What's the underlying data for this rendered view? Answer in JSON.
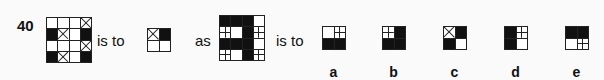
{
  "question": {
    "number": "40",
    "connector_1": "is to",
    "connector_2": "as",
    "connector_3": "is to",
    "legend": {
      "W": "white",
      "B": "black",
      "X": "crossed",
      "P": "quartered"
    },
    "grid_1": [
      [
        "W",
        "W",
        "W",
        "X"
      ],
      [
        "B",
        "X",
        "W",
        "B"
      ],
      [
        "W",
        "W",
        "W",
        "X"
      ],
      [
        "B",
        "X",
        "W",
        "B"
      ]
    ],
    "grid_2": [
      [
        "X",
        "B"
      ],
      [
        "W",
        "W"
      ]
    ],
    "grid_3": [
      [
        "B",
        "B",
        "B",
        "W"
      ],
      [
        "P",
        "W",
        "B",
        "P"
      ],
      [
        "B",
        "B",
        "B",
        "W"
      ],
      [
        "P",
        "W",
        "B",
        "P"
      ]
    ]
  },
  "options": [
    {
      "label": "a",
      "cells": [
        [
          "W",
          "P"
        ],
        [
          "B",
          "B"
        ]
      ]
    },
    {
      "label": "b",
      "cells": [
        [
          "P",
          "B"
        ],
        [
          "B",
          "B"
        ]
      ]
    },
    {
      "label": "c",
      "cells": [
        [
          "X",
          "B"
        ],
        [
          "B",
          "W"
        ]
      ]
    },
    {
      "label": "d",
      "cells": [
        [
          "B",
          "P"
        ],
        [
          "B",
          "W"
        ]
      ]
    },
    {
      "label": "e",
      "cells": [
        [
          "B",
          "B"
        ],
        [
          "W",
          "P"
        ]
      ]
    }
  ]
}
